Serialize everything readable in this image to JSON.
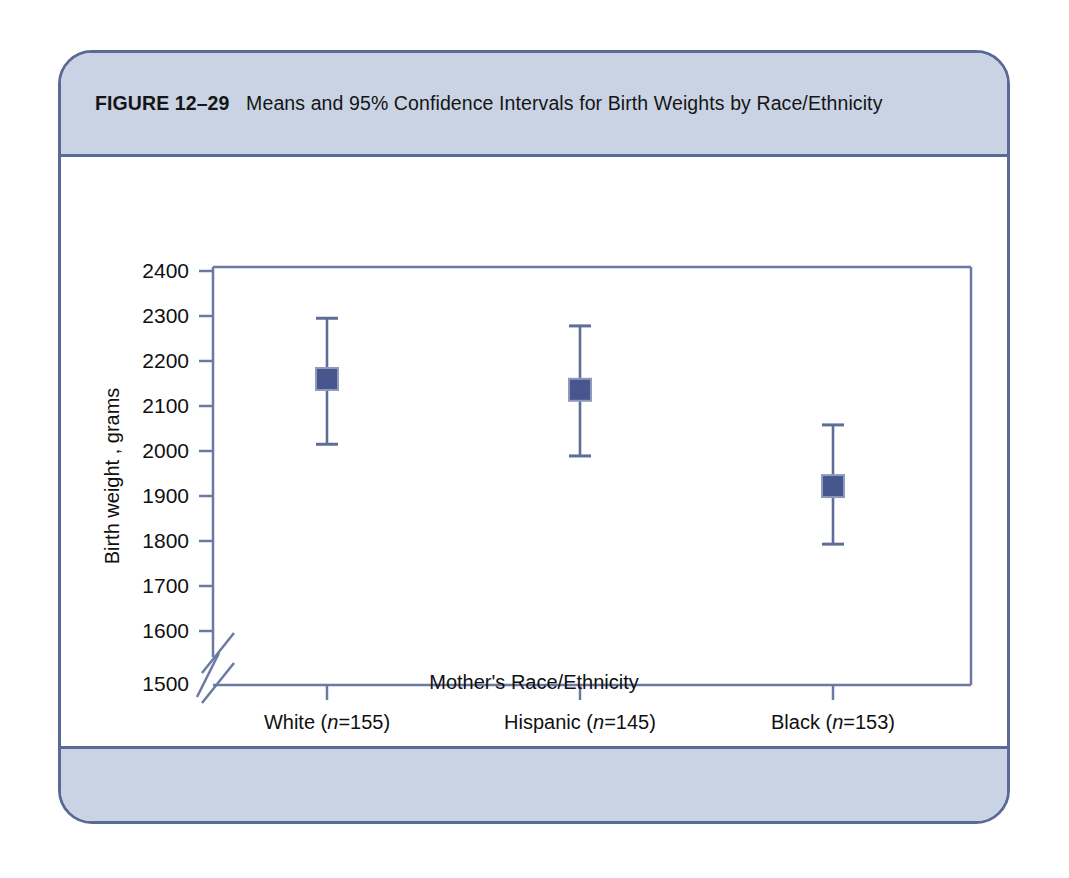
{
  "figure": {
    "number_label": "FIGURE 12–29",
    "caption": "Means and 95% Confidence Intervals for Birth Weights by Race/Ethnicity"
  },
  "colors": {
    "panel_border": "#5a6a96",
    "band_fill": "#c9d3e3",
    "axis_line": "#6b7aa3",
    "marker_fill": "#47578d",
    "marker_edge": "#8f9bbd",
    "errorbar": "#5e6e99",
    "text": "#101010",
    "page_background": "#ffffff"
  },
  "chart_data": {
    "type": "scatter",
    "title": "Means and 95% Confidence Intervals for Birth Weights by Race/Ethnicity",
    "xlabel": "Mother's Race/Ethnicity",
    "ylabel": "Birth weight , grams",
    "categories": [
      "White (n=155)",
      "Hispanic (n=145)",
      "Black (n=153)"
    ],
    "category_parts": [
      {
        "name": "White",
        "n_prefix": " (",
        "n_italic": "n",
        "n_value": "=155)"
      },
      {
        "name": "Hispanic",
        "n_prefix": " (",
        "n_italic": "n",
        "n_value": "=145)"
      },
      {
        "name": "Black",
        "n_prefix": " (",
        "n_italic": "n",
        "n_value": "=153)"
      }
    ],
    "values": [
      2160,
      2136,
      1922
    ],
    "ci_lower": [
      2015,
      1989,
      1793
    ],
    "ci_upper": [
      2295,
      2278,
      2058
    ],
    "series": [
      {
        "name": "Mean birth weight with 95% CI",
        "points": [
          {
            "category": "White (n=155)",
            "mean": 2160,
            "ci_lower": 2015,
            "ci_upper": 2295
          },
          {
            "category": "Hispanic (n=145)",
            "mean": 2136,
            "ci_lower": 1989,
            "ci_upper": 2278
          },
          {
            "category": "Black (n=153)",
            "mean": 1922,
            "ci_lower": 1793,
            "ci_upper": 2058
          }
        ]
      }
    ],
    "ylim": [
      1500,
      2400
    ],
    "ytick_labels": [
      "1500",
      "1600",
      "1700",
      "1800",
      "1900",
      "2000",
      "2100",
      "2200",
      "2300",
      "2400"
    ],
    "ytick_values": [
      1500,
      1600,
      1700,
      1800,
      1900,
      2000,
      2100,
      2200,
      2300,
      2400
    ],
    "axis_break": true,
    "axis_break_between": [
      1500,
      1600
    ],
    "grid": false,
    "legend": "none",
    "units": "grams",
    "confidence_level": "95%"
  }
}
